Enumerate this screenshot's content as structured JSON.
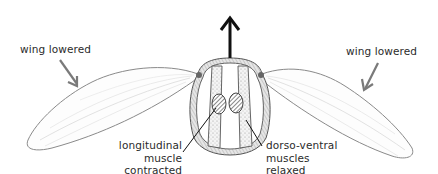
{
  "diagram": {
    "type": "insect-flight-mechanism-cross-section",
    "labels": {
      "left_wing": "wing lowered",
      "right_wing": "wing lowered",
      "longitudinal": [
        "longitudinal",
        "muscle",
        "contracted"
      ],
      "dorso_ventral": [
        "dorso-ventral",
        "muscles",
        "relaxed"
      ]
    },
    "arrows": [
      {
        "name": "thorax-upward-arrow",
        "direction": "up"
      },
      {
        "name": "left-wing-down-arrow",
        "direction": "down-right"
      },
      {
        "name": "right-wing-down-arrow",
        "direction": "down-left"
      }
    ],
    "colors": {
      "outline": "#555555",
      "wing_stroke": "#8a8a8a",
      "arrow_gray": "#7a7a7a",
      "arrow_black": "#111111",
      "text": "#2b2b2b"
    }
  }
}
